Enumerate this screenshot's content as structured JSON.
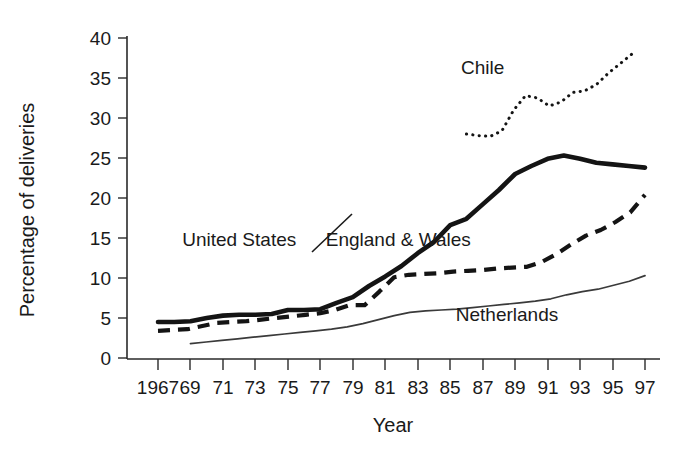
{
  "chart_data": {
    "type": "line",
    "title": "",
    "xlabel": "Year",
    "ylabel": "Percentage of deliveries",
    "xlim": [
      1967,
      1997
    ],
    "ylim": [
      0,
      40
    ],
    "yticks": [
      0,
      5,
      10,
      15,
      20,
      25,
      30,
      35,
      40
    ],
    "ytick_labels": [
      "0",
      "5",
      "10",
      "15",
      "20",
      "25",
      "30",
      "35",
      "40"
    ],
    "xticks": [
      1967,
      1969,
      1971,
      1973,
      1975,
      1977,
      1979,
      1981,
      1983,
      1985,
      1987,
      1989,
      1991,
      1993,
      1995,
      1997
    ],
    "xtick_labels": [
      "1967",
      "69",
      "71",
      "73",
      "75",
      "77",
      "79",
      "81",
      "83",
      "85",
      "87",
      "89",
      "91",
      "93",
      "95",
      "97"
    ],
    "grid": false,
    "legend_position": "inline-labels",
    "series": [
      {
        "name": "United States",
        "style": "thick-solid",
        "color": "#141414",
        "x": [
          1967,
          1968,
          1969,
          1970,
          1971,
          1972,
          1973,
          1974,
          1975,
          1976,
          1977,
          1978,
          1979,
          1980,
          1981,
          1982,
          1983,
          1984,
          1985,
          1986,
          1987,
          1988,
          1989,
          1990,
          1991,
          1992,
          1993,
          1994,
          1995,
          1996,
          1997
        ],
        "values": [
          4.5,
          4.5,
          4.6,
          5.0,
          5.3,
          5.4,
          5.4,
          5.5,
          6.0,
          6.0,
          6.1,
          6.9,
          7.6,
          9.0,
          10.2,
          11.5,
          13.1,
          14.5,
          16.6,
          17.4,
          19.2,
          21.0,
          23.0,
          24.0,
          24.9,
          25.3,
          24.9,
          24.4,
          24.2,
          24.0,
          23.8
        ],
        "values_note": "see x_map"
      },
      {
        "name": "England & Wales",
        "style": "dashed",
        "color": "#141414",
        "values": [
          3.4,
          3.5,
          3.6,
          4.0,
          4.4,
          4.5,
          4.6,
          4.8,
          5.0,
          5.2,
          5.4,
          5.6,
          6.0,
          6.6,
          6.6,
          8.3,
          10.1,
          10.4,
          10.5,
          10.6,
          10.8,
          10.9,
          11.0,
          11.2,
          11.3,
          11.4,
          12.0,
          13.0,
          14.2,
          15.3,
          16.0,
          17.0,
          18.2,
          20.4
        ]
      },
      {
        "name": "Netherlands",
        "style": "thin-solid",
        "color": "#3a3a3a",
        "values": [
          1.8,
          2.0,
          2.2,
          2.4,
          2.6,
          2.8,
          3.0,
          3.2,
          3.4,
          3.6,
          3.9,
          4.3,
          4.8,
          5.3,
          5.7,
          5.9,
          6.0,
          6.1,
          6.3,
          6.5,
          6.7,
          6.9,
          7.1,
          7.4,
          7.9,
          8.3,
          8.6,
          9.1,
          9.6,
          10.3
        ]
      },
      {
        "name": "Chile",
        "style": "dotted",
        "color": "#141414",
        "values": [
          28.0,
          27.8,
          27.7,
          28.4,
          31.0,
          32.8,
          32.5,
          31.5,
          32.0,
          33.2,
          33.4,
          34.2,
          35.6,
          36.8,
          38.0
        ]
      }
    ],
    "annotations": [
      {
        "text": "Chile",
        "x": 1987.0,
        "y": 35.5
      },
      {
        "text": "United States",
        "x": 1972.0,
        "y": 14.0
      },
      {
        "text": "England & Wales",
        "x": 1981.8,
        "y": 14.0
      },
      {
        "text": "Netherlands",
        "x": 1988.5,
        "y": 4.6
      }
    ]
  },
  "labels": {
    "ylabel": "Percentage of deliveries",
    "xlabel": "Year",
    "series_us": "United States",
    "series_ew": "England & Wales",
    "series_nl": "Netherlands",
    "series_cl": "Chile"
  },
  "ytick_0": "0",
  "ytick_5": "5",
  "ytick_10": "10",
  "ytick_15": "15",
  "ytick_20": "20",
  "ytick_25": "25",
  "ytick_30": "30",
  "ytick_35": "35",
  "ytick_40": "40",
  "xtick_1967": "1967",
  "xtick_69": "69",
  "xtick_71": "71",
  "xtick_73": "73",
  "xtick_75": "75",
  "xtick_77": "77",
  "xtick_79": "79",
  "xtick_81": "81",
  "xtick_83": "83",
  "xtick_85": "85",
  "xtick_87": "87",
  "xtick_89": "89",
  "xtick_91": "91",
  "xtick_93": "93",
  "xtick_95": "95",
  "xtick_97": "97"
}
